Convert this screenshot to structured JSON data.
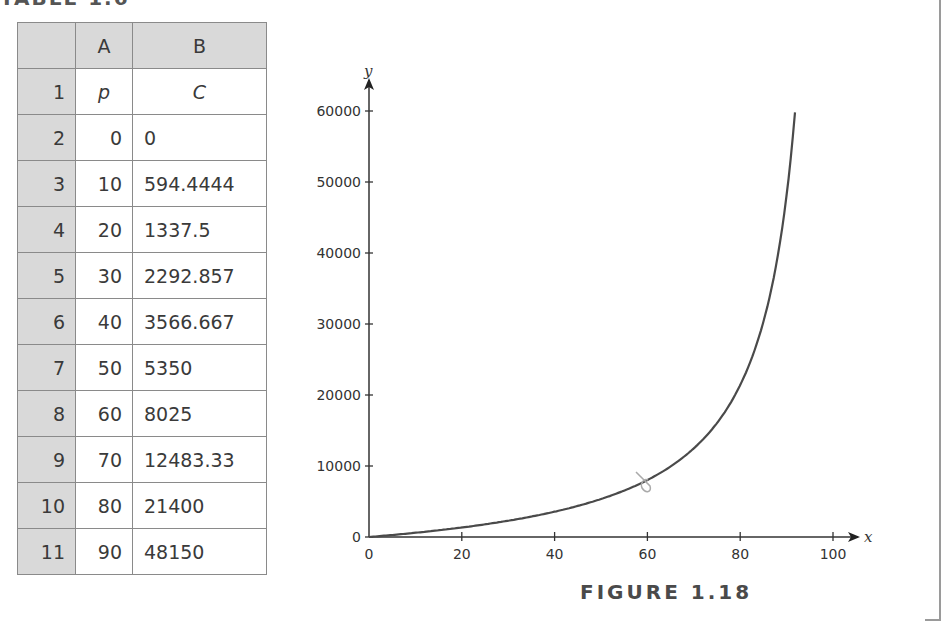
{
  "table": {
    "title": "TABLE 1.6",
    "column_headers": [
      "",
      "A",
      "B"
    ],
    "rows": [
      {
        "row": "1",
        "a": "p",
        "b": "C"
      },
      {
        "row": "2",
        "a": "0",
        "b": "0"
      },
      {
        "row": "3",
        "a": "10",
        "b": "594.4444"
      },
      {
        "row": "4",
        "a": "20",
        "b": "1337.5"
      },
      {
        "row": "5",
        "a": "30",
        "b": "2292.857"
      },
      {
        "row": "6",
        "a": "40",
        "b": "3566.667"
      },
      {
        "row": "7",
        "a": "50",
        "b": "5350"
      },
      {
        "row": "8",
        "a": "60",
        "b": "8025"
      },
      {
        "row": "9",
        "a": "70",
        "b": "12483.33"
      },
      {
        "row": "10",
        "a": "80",
        "b": "21400"
      },
      {
        "row": "11",
        "a": "90",
        "b": "48150"
      }
    ]
  },
  "figure": {
    "caption": "FIGURE 1.18",
    "x_axis_name": "x",
    "y_axis_name": "y",
    "x_ticks": [
      "0",
      "20",
      "40",
      "60",
      "80",
      "100"
    ],
    "y_ticks": [
      "0",
      "10000",
      "20000",
      "30000",
      "40000",
      "50000",
      "60000"
    ]
  },
  "colors": {
    "header_fill": "#d9d9d9",
    "grid_border": "#8a8a8a",
    "curve": "#4a4a4a",
    "caption": "#4a4a4a"
  },
  "chart_data": {
    "type": "line",
    "title": "FIGURE 1.18",
    "xlabel": "x",
    "ylabel": "y",
    "xlim": [
      0,
      100
    ],
    "ylim": [
      0,
      60000
    ],
    "grid": false,
    "legend": null,
    "x_ticks": [
      0,
      20,
      40,
      60,
      80,
      100
    ],
    "y_ticks": [
      0,
      10000,
      20000,
      30000,
      40000,
      50000,
      60000
    ],
    "series": [
      {
        "name": "C",
        "x": [
          0,
          10,
          20,
          30,
          40,
          50,
          60,
          70,
          80,
          90,
          91.8
        ],
        "values": [
          0,
          594.4444,
          1337.5,
          2292.857,
          3566.667,
          5350,
          8025,
          12483.33,
          21400,
          48150,
          59800
        ]
      }
    ]
  }
}
